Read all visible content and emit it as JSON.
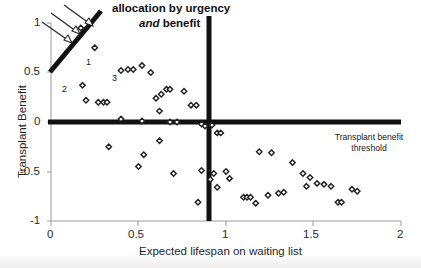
{
  "chart_data": {
    "type": "scatter",
    "title": "",
    "xlabel": "Expected lifespan on waiting list",
    "ylabel": "Transplant Benefit",
    "xlim": [
      0,
      2
    ],
    "ylim": [
      -1,
      1
    ],
    "xticks": [
      0,
      0.5,
      1,
      1.5,
      2
    ],
    "xtick_labels": [
      "0",
      "0.5",
      "1",
      "1.5",
      "2"
    ],
    "yticks": [
      1,
      0.5,
      0,
      -0.5,
      -1
    ],
    "ytick_labels": [
      "1",
      "0.5",
      "0",
      "-0.5",
      "-1"
    ],
    "grid": false,
    "legend": null,
    "marker": "open-diamond",
    "points": [
      {
        "x": 0.17,
        "y": 0.95
      },
      {
        "x": 0.25,
        "y": 0.75,
        "label": "1"
      },
      {
        "x": 0.18,
        "y": 0.37,
        "label": "2"
      },
      {
        "x": 0.4,
        "y": 0.52,
        "label": "3"
      },
      {
        "x": 0.44,
        "y": 0.53
      },
      {
        "x": 0.47,
        "y": 0.53
      },
      {
        "x": 0.52,
        "y": 0.57
      },
      {
        "x": 0.57,
        "y": 0.5
      },
      {
        "x": 0.2,
        "y": 0.22
      },
      {
        "x": 0.27,
        "y": 0.2
      },
      {
        "x": 0.3,
        "y": 0.2
      },
      {
        "x": 0.32,
        "y": 0.2
      },
      {
        "x": 0.6,
        "y": 0.24
      },
      {
        "x": 0.63,
        "y": 0.28
      },
      {
        "x": 0.66,
        "y": 0.33
      },
      {
        "x": 0.68,
        "y": 0.33
      },
      {
        "x": 0.76,
        "y": 0.31
      },
      {
        "x": 0.62,
        "y": 0.11
      },
      {
        "x": 0.8,
        "y": 0.17
      },
      {
        "x": 0.83,
        "y": 0.17
      },
      {
        "x": 0.4,
        "y": 0.03
      },
      {
        "x": 0.52,
        "y": 0.01
      },
      {
        "x": 0.68,
        "y": 0.0
      },
      {
        "x": 0.72,
        "y": 0.0
      },
      {
        "x": 0.86,
        "y": -0.02
      },
      {
        "x": 0.88,
        "y": -0.04
      },
      {
        "x": 0.92,
        "y": -0.03
      },
      {
        "x": 0.95,
        "y": -0.11
      },
      {
        "x": 0.97,
        "y": -0.11
      },
      {
        "x": 0.33,
        "y": -0.25
      },
      {
        "x": 0.53,
        "y": -0.33
      },
      {
        "x": 0.5,
        "y": -0.45
      },
      {
        "x": 0.62,
        "y": -0.19
      },
      {
        "x": 0.7,
        "y": -0.52
      },
      {
        "x": 0.86,
        "y": -0.49
      },
      {
        "x": 0.84,
        "y": -0.81
      },
      {
        "x": 0.93,
        "y": -0.52
      },
      {
        "x": 0.91,
        "y": -0.58
      },
      {
        "x": 0.95,
        "y": -0.66
      },
      {
        "x": 1.0,
        "y": -0.5
      },
      {
        "x": 1.02,
        "y": -0.57
      },
      {
        "x": 1.1,
        "y": -0.76
      },
      {
        "x": 1.12,
        "y": -0.76
      },
      {
        "x": 1.14,
        "y": -0.76
      },
      {
        "x": 1.17,
        "y": -0.82
      },
      {
        "x": 1.19,
        "y": -0.3
      },
      {
        "x": 1.26,
        "y": -0.31
      },
      {
        "x": 1.24,
        "y": -0.74
      },
      {
        "x": 1.3,
        "y": -0.72
      },
      {
        "x": 1.33,
        "y": -0.71
      },
      {
        "x": 1.38,
        "y": -0.41
      },
      {
        "x": 1.44,
        "y": -0.52
      },
      {
        "x": 1.48,
        "y": -0.56
      },
      {
        "x": 1.46,
        "y": -0.65
      },
      {
        "x": 1.52,
        "y": -0.62
      },
      {
        "x": 1.56,
        "y": -0.63
      },
      {
        "x": 1.6,
        "y": -0.65
      },
      {
        "x": 1.64,
        "y": -0.81
      },
      {
        "x": 1.66,
        "y": -0.81
      },
      {
        "x": 1.72,
        "y": -0.68
      },
      {
        "x": 1.75,
        "y": -0.7
      }
    ],
    "lines": [
      {
        "name": "urgency-benefit-allocation-line",
        "style": "thick-solid-diagonal",
        "from": {
          "x": 0.0,
          "y": 0.51
        },
        "to": {
          "x": 0.29,
          "y": 1.12
        }
      },
      {
        "name": "transplant-benefit-threshold-line",
        "style": "thick-solid-horizontal",
        "from": {
          "x": 0.0,
          "y": 0.0
        },
        "to": {
          "x": 2.0,
          "y": 0.0
        }
      },
      {
        "name": "urgency-threshold-line",
        "style": "thick-solid-vertical",
        "from": {
          "x": 0.885,
          "y": 1.08
        },
        "to": {
          "x": 0.885,
          "y": -1.0
        }
      }
    ],
    "annotations": [
      {
        "name": "allocation-callout",
        "line1": "allocation by urgency",
        "line2_italic": "and",
        "line2_rest": "benefit",
        "arrows": 3
      },
      {
        "name": "threshold-callout",
        "line1": "Transplant benefit",
        "line2": "threshold"
      }
    ],
    "point_labels": [
      "1",
      "2",
      "3"
    ],
    "colors": {
      "ink": "#111111",
      "axis": "#8d8d8d",
      "marker_edge": "#222222",
      "marker_fill": "#ffffff",
      "background": "#ffffff"
    }
  }
}
